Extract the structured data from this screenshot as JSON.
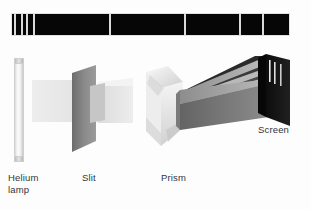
{
  "figure": {
    "type": "optics-diagram",
    "background_color": "#fdfdfd"
  },
  "spectrum": {
    "name": "helium-emission-spectrum-strip",
    "x": 11,
    "y": 13,
    "width": 279,
    "height": 23,
    "background_color": "#060606",
    "line_color": "#d9d9d9",
    "line_width": 1.5,
    "line_positions": [
      13,
      20,
      25,
      32,
      108,
      183,
      238,
      261
    ],
    "line_count": 8
  },
  "components": {
    "lamp": {
      "label": "Helium\nlamp",
      "label_x": 8,
      "label_y": 172,
      "x": 14,
      "y": 58,
      "width": 10,
      "height": 104
    },
    "slit": {
      "label": "Slit",
      "label_x": 82,
      "label_y": 172
    },
    "prism": {
      "label": "Prism",
      "label_x": 161,
      "label_y": 172
    },
    "screen": {
      "label": "Screen",
      "label_x": 258,
      "label_y": 124
    }
  },
  "colors": {
    "background": "#fdfdfd",
    "spectrum_black": "#060606",
    "spectrum_line": "#d9d9d9",
    "plate_gray": "#8b8b8b",
    "beam_gray": "#e6e6e6",
    "fan_dark": "#6b6b6b",
    "screen_black": "#111111",
    "text": "#33353a"
  }
}
